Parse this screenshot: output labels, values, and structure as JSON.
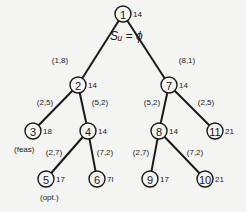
{
  "title": "Sᵤ = ϕ",
  "nodes": [
    {
      "id": "1",
      "x": 123,
      "y": 14,
      "bound": "14"
    },
    {
      "id": "2",
      "x": 78,
      "y": 85,
      "bound": "14"
    },
    {
      "id": "3",
      "x": 33,
      "y": 131,
      "bound": "18"
    },
    {
      "id": "4",
      "x": 88,
      "y": 131,
      "bound": "14"
    },
    {
      "id": "5",
      "x": 46,
      "y": 179,
      "bound": "17"
    },
    {
      "id": "6",
      "x": 97,
      "y": 179,
      "bound": "7l"
    },
    {
      "id": "7",
      "x": 169,
      "y": 85,
      "bound": "14"
    },
    {
      "id": "8",
      "x": 159,
      "y": 131,
      "bound": "14"
    },
    {
      "id": "9",
      "x": 150,
      "y": 179,
      "bound": "17"
    },
    {
      "id": "10",
      "x": 205,
      "y": 179,
      "bound": "21"
    },
    {
      "id": "11",
      "x": 215,
      "y": 131,
      "bound": "21"
    }
  ],
  "edges": [
    {
      "from": "1",
      "to": "2",
      "label": "(1,8)",
      "lx": 60,
      "ly": 63
    },
    {
      "from": "1",
      "to": "7",
      "label": "(8,1)",
      "lx": 187,
      "ly": 63
    },
    {
      "from": "2",
      "to": "3",
      "label": "(2,5)",
      "lx": 45,
      "ly": 105
    },
    {
      "from": "2",
      "to": "4",
      "label": "(5,2)",
      "lx": 100,
      "ly": 105
    },
    {
      "from": "4",
      "to": "5",
      "label": "(2,7)",
      "lx": 54,
      "ly": 155
    },
    {
      "from": "4",
      "to": "6",
      "label": "(7,2)",
      "lx": 105,
      "ly": 155
    },
    {
      "from": "7",
      "to": "8",
      "label": "(5,2)",
      "lx": 152,
      "ly": 105
    },
    {
      "from": "7",
      "to": "11",
      "label": "(2,5)",
      "lx": 206,
      "ly": 105
    },
    {
      "from": "8",
      "to": "9",
      "label": "(2,7)",
      "lx": 141,
      "ly": 155
    },
    {
      "from": "8",
      "to": "10",
      "label": "(7,2)",
      "lx": 195,
      "ly": 155
    }
  ],
  "annotations": [
    {
      "text": "(feas)",
      "x": 14,
      "y": 152
    },
    {
      "text": "(opt.)",
      "x": 40,
      "y": 200
    }
  ]
}
